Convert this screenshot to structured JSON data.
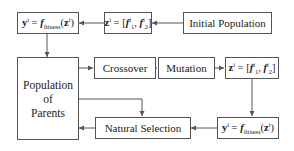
{
  "diagram": {
    "nodes": {
      "fitness_top": {
        "lhs": "y",
        "lhs_sup": "i",
        "eq": " = ",
        "func": "f",
        "func_sub": "fitness",
        "arg_open": "(",
        "arg": "z",
        "arg_sup": "i",
        "arg_close": ")"
      },
      "encode_top": {
        "lhs": "z",
        "lhs_sup": "i",
        "eq": " = [",
        "f1": "f",
        "f1_sub": "1",
        "f1_sup": "i",
        "sep": ", ",
        "f2": "f",
        "f2_sub": "2",
        "f2_sup": "i",
        "close": "]"
      },
      "initial_population": {
        "label": "Initial Population"
      },
      "population_of_parents": {
        "line1": "Population",
        "line2": "of",
        "line3": "Parents"
      },
      "crossover": {
        "label": "Crossover"
      },
      "mutation": {
        "label": "Mutation"
      },
      "encode_right": {
        "lhs": "z",
        "lhs_sup": "i",
        "eq": " = [",
        "f1": "f",
        "f1_sub": "1",
        "f1_sup": "i",
        "sep": ", ",
        "f2": "f",
        "f2_sub": "2",
        "f2_sup": "i",
        "close": "]"
      },
      "natural_selection": {
        "label": "Natural Selection"
      },
      "fitness_right": {
        "lhs": "y",
        "lhs_sup": "i",
        "eq": " = ",
        "func": "f",
        "func_sub": "fitness",
        "arg_open": "(",
        "arg": "z",
        "arg_sup": "i",
        "arg_close": ")"
      }
    },
    "edges": [
      {
        "from": "initial_population",
        "to": "encode_top"
      },
      {
        "from": "encode_top",
        "to": "fitness_top"
      },
      {
        "from": "fitness_top",
        "to": "population_of_parents"
      },
      {
        "from": "population_of_parents",
        "to": "crossover"
      },
      {
        "from": "crossover",
        "to": "mutation"
      },
      {
        "from": "mutation",
        "to": "encode_right"
      },
      {
        "from": "encode_right",
        "to": "fitness_right"
      },
      {
        "from": "fitness_right",
        "to": "natural_selection"
      },
      {
        "from": "population_of_parents",
        "to": "natural_selection"
      },
      {
        "from": "natural_selection",
        "to": "population_of_parents"
      }
    ],
    "colors": {
      "stroke": "#555555",
      "text": "#222222",
      "background": "#ffffff"
    }
  }
}
